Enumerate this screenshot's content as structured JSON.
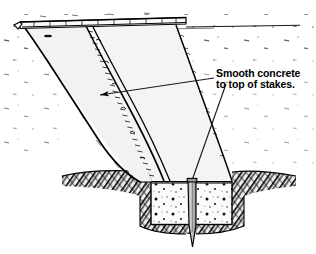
{
  "drawing": {
    "title": "Concrete slab on grade with thickened edge footing and stake",
    "type": "construction-section-detail",
    "style": "pen-and-ink line drawing",
    "background_color": "#ffffff",
    "ink_color": "#000000"
  },
  "callout": {
    "line1": "Smooth concrete",
    "line2": "to top of stakes.",
    "full_text": "Smooth concrete to top of stakes.",
    "text_color": "#1a1a1a",
    "leader_count": 2,
    "leaders": [
      {
        "name": "leader-to-slab-surface",
        "has_arrowhead": true,
        "points_to": "concrete slab top surface"
      },
      {
        "name": "leader-to-stake-top",
        "has_arrowhead": false,
        "points_to": "top of wooden stake"
      }
    ]
  },
  "elements": {
    "slab": {
      "label": "concrete slab",
      "fill_color": "#f2f2f0",
      "edge": "broken ragged concrete edge"
    },
    "form_board": {
      "label": "form board at top edge",
      "fill_color": "#fafafa"
    },
    "footing": {
      "label": "concrete footing",
      "fill_color": "#fbfbfa",
      "texture": "aggregate speckle"
    },
    "stake": {
      "label": "wood stake",
      "fill_color": "#c9c9c7",
      "tip": "pointed",
      "orientation": "vertical"
    },
    "soil": {
      "label": "excavated soil / earth",
      "fill_color": "#2b2b2b",
      "texture": "cross-hatched"
    },
    "ground_texture": {
      "label": "ground stipple texture",
      "color": "#555555"
    }
  }
}
